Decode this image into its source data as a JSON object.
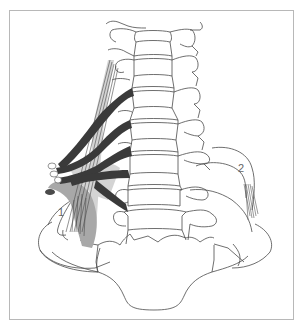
{
  "figure": {
    "type": "anatomical-line-drawing",
    "labels": [
      {
        "id": "1",
        "text": "1"
      },
      {
        "id": "2",
        "text": "2"
      }
    ]
  },
  "colors": {
    "frame": "#b8b8b8",
    "outline": "#4a4a4a",
    "nerve": "#3a3a3a",
    "muscle_light": "#d4d4d4",
    "muscle_dark": "#a8a8a8"
  }
}
